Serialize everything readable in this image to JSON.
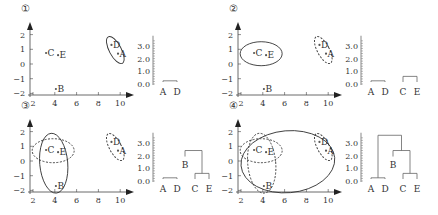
{
  "chart_data": {
    "type": "scatter",
    "points": [
      {
        "label": "A",
        "x": 9.8,
        "y": 0.7
      },
      {
        "label": "B",
        "x": 4.1,
        "y": -1.7
      },
      {
        "label": "C",
        "x": 3.2,
        "y": 0.75
      },
      {
        "label": "D",
        "x": 9.2,
        "y": 1.3
      },
      {
        "label": "E",
        "x": 4.3,
        "y": 0.6
      }
    ],
    "scatter_axes": {
      "xlim": [
        2,
        10.5
      ],
      "ylim": [
        -2,
        2.3
      ],
      "xticks": [
        "2",
        "4",
        "6",
        "8",
        "10"
      ],
      "yticks": [
        "2",
        "1",
        "0",
        "−1",
        "−2"
      ]
    },
    "dendrogram_axis": {
      "ylim": [
        0,
        3.8
      ],
      "ticks": [
        "3.0",
        "2.0",
        "1.0",
        "0.0"
      ]
    },
    "panels": [
      {
        "step": "①",
        "clusters_solid": [
          [
            "A",
            "D"
          ]
        ],
        "clusters_dashed": [],
        "merges": [
          {
            "members": [
              "A",
              "D"
            ],
            "height": 0.25
          }
        ]
      },
      {
        "step": "②",
        "clusters_solid": [
          [
            "C",
            "E"
          ]
        ],
        "clusters_dashed": [
          [
            "A",
            "D"
          ]
        ],
        "merges": [
          {
            "members": [
              "A",
              "D"
            ],
            "height": 0.25
          },
          {
            "members": [
              "C",
              "E"
            ],
            "height": 0.6
          }
        ]
      },
      {
        "step": "③",
        "clusters_solid": [
          [
            "B",
            "C",
            "E"
          ]
        ],
        "clusters_dashed": [
          [
            "A",
            "D"
          ],
          [
            "C",
            "E"
          ]
        ],
        "merges": [
          {
            "members": [
              "A",
              "D"
            ],
            "height": 0.25
          },
          {
            "members": [
              "C",
              "E"
            ],
            "height": 0.6
          },
          {
            "members": [
              "B",
              "CE"
            ],
            "height": 2.4
          }
        ]
      },
      {
        "step": "④",
        "clusters_solid": [
          [
            "A",
            "B",
            "C",
            "D",
            "E"
          ]
        ],
        "clusters_dashed": [
          [
            "A",
            "D"
          ],
          [
            "C",
            "E"
          ],
          [
            "B",
            "C",
            "E"
          ]
        ],
        "merges": [
          {
            "members": [
              "A",
              "D"
            ],
            "height": 0.25
          },
          {
            "members": [
              "C",
              "E"
            ],
            "height": 0.6
          },
          {
            "members": [
              "B",
              "CE"
            ],
            "height": 2.4
          },
          {
            "members": [
              "AD",
              "BCE"
            ],
            "height": 3.6
          }
        ]
      }
    ]
  }
}
